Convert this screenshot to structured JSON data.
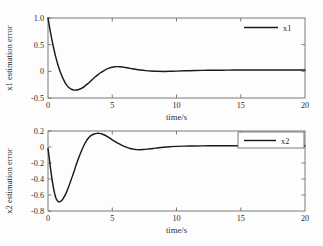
{
  "figure": {
    "background": "#fdfdfd",
    "curve_color": "#1a1a1a",
    "axis_color": "#6d6d6d"
  },
  "chart_data": [
    {
      "type": "line",
      "id": "x1-estimation-error",
      "title": "",
      "xlabel": "time/s",
      "ylabel": "x1 estimation error",
      "xlim": [
        0,
        20
      ],
      "ylim": [
        -0.5,
        1.0
      ],
      "xticks": [
        0,
        5,
        10,
        15,
        20
      ],
      "xtick_labels": [
        "0",
        "5",
        "10",
        "15",
        "20"
      ],
      "yticks": [
        -0.5,
        0,
        0.5,
        1.0
      ],
      "ytick_labels": [
        "-0.5",
        "0",
        "0.5",
        "1.0"
      ],
      "grid": false,
      "legend": {
        "position": "upper-right",
        "entries": [
          {
            "name": "x1",
            "color": "#1a1a1a"
          }
        ]
      },
      "series": [
        {
          "name": "x1",
          "color": "#1a1a1a",
          "x": [
            0.0,
            0.2,
            0.4,
            0.6,
            0.8,
            1.0,
            1.2,
            1.4,
            1.6,
            1.8,
            2.0,
            2.1,
            2.2,
            2.4,
            2.6,
            2.8,
            3.0,
            3.2,
            3.4,
            3.6,
            3.8,
            4.0,
            4.2,
            4.4,
            4.6,
            4.8,
            5.0,
            5.2,
            5.4,
            5.6,
            5.8,
            6.0,
            6.4,
            6.8,
            7.2,
            7.6,
            8.0,
            8.5,
            9.0,
            9.5,
            10.0,
            11.0,
            12.0,
            13.0,
            14.0,
            15.0,
            16.0,
            17.0,
            18.0,
            19.0,
            20.0
          ],
          "y": [
            1.0,
            0.72,
            0.48,
            0.27,
            0.1,
            -0.04,
            -0.15,
            -0.24,
            -0.3,
            -0.335,
            -0.35,
            -0.352,
            -0.35,
            -0.34,
            -0.32,
            -0.29,
            -0.25,
            -0.21,
            -0.165,
            -0.12,
            -0.08,
            -0.04,
            -0.01,
            0.02,
            0.045,
            0.065,
            0.078,
            0.085,
            0.088,
            0.086,
            0.08,
            0.072,
            0.055,
            0.038,
            0.024,
            0.013,
            0.006,
            0.0,
            -0.002,
            0.0,
            0.004,
            0.012,
            0.018,
            0.021,
            0.023,
            0.024,
            0.025,
            0.025,
            0.026,
            0.026,
            0.026
          ]
        }
      ]
    },
    {
      "type": "line",
      "id": "x2-estimation-error",
      "title": "",
      "xlabel": "time/s",
      "ylabel": "x2 estimation error",
      "xlim": [
        0,
        20
      ],
      "ylim": [
        -0.8,
        0.2
      ],
      "xticks": [
        0,
        5,
        10,
        15,
        20
      ],
      "xtick_labels": [
        "0",
        "5",
        "10",
        "15",
        "20"
      ],
      "yticks": [
        -0.8,
        -0.6,
        -0.4,
        -0.2,
        0,
        0.2
      ],
      "ytick_labels": [
        "-0.8",
        "-0.6",
        "-0.4",
        "-0.2",
        "0",
        "0.2"
      ],
      "grid": false,
      "legend": {
        "position": "upper-right",
        "entries": [
          {
            "name": "x2",
            "color": "#1a1a1a"
          }
        ]
      },
      "series": [
        {
          "name": "x2",
          "color": "#1a1a1a",
          "x": [
            0.0,
            0.1,
            0.2,
            0.3,
            0.4,
            0.5,
            0.6,
            0.7,
            0.8,
            0.9,
            1.0,
            1.1,
            1.2,
            1.4,
            1.6,
            1.8,
            2.0,
            2.2,
            2.4,
            2.6,
            2.8,
            3.0,
            3.2,
            3.4,
            3.6,
            3.8,
            4.0,
            4.2,
            4.4,
            4.6,
            4.8,
            5.0,
            5.2,
            5.5,
            5.8,
            6.0,
            6.4,
            6.8,
            7.0,
            7.4,
            7.8,
            8.2,
            8.6,
            9.0,
            9.5,
            10.0,
            11.0,
            12.0,
            13.0,
            14.0,
            15.0,
            16.0,
            17.0,
            18.0,
            19.0,
            20.0
          ],
          "y": [
            -0.02,
            -0.14,
            -0.27,
            -0.39,
            -0.49,
            -0.57,
            -0.63,
            -0.665,
            -0.682,
            -0.685,
            -0.678,
            -0.662,
            -0.64,
            -0.58,
            -0.5,
            -0.41,
            -0.32,
            -0.22,
            -0.13,
            -0.05,
            0.022,
            0.08,
            0.122,
            0.148,
            0.163,
            0.17,
            0.17,
            0.163,
            0.15,
            0.132,
            0.112,
            0.09,
            0.07,
            0.042,
            0.018,
            0.004,
            -0.018,
            -0.03,
            -0.033,
            -0.032,
            -0.026,
            -0.018,
            -0.009,
            -0.002,
            0.004,
            0.008,
            0.012,
            0.014,
            0.015,
            0.016,
            0.016,
            0.017,
            0.017,
            0.017,
            0.017,
            0.017
          ]
        }
      ]
    }
  ]
}
